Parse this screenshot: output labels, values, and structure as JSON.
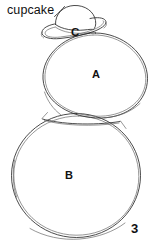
{
  "figure": {
    "number": "3",
    "background_color": "#ffffff",
    "ink_color": "#2b2b2b",
    "width": 152,
    "height": 245
  },
  "annotations": [
    {
      "id": "cupcake",
      "text": "cupcake",
      "target": "hat-shape",
      "has_leader_line": true
    }
  ],
  "region_labels": {
    "a": "A",
    "b": "B",
    "c": "C"
  },
  "shapes": {
    "upper_circle": {
      "label": "A",
      "description": "upper sketched circle"
    },
    "lower_circle": {
      "label": "B",
      "description": "lower larger sketched circle"
    },
    "hat": {
      "label": "C",
      "description": "brimmed hat resting on top circle"
    }
  }
}
